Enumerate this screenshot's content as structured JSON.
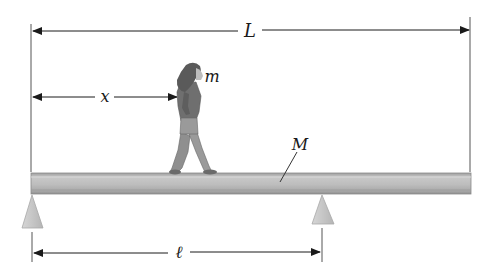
{
  "diagram": {
    "labels": {
      "total_length": "L",
      "person_position": "x",
      "person_mass": "m",
      "beam_mass": "M",
      "support_distance": "ℓ"
    },
    "colors": {
      "beam_fill": "#b9b9b9",
      "beam_edge": "#8a8a8a",
      "support_fill": "#c4c4c4",
      "line": "#1a1a1a",
      "guide_line": "#555555",
      "person_clothes": "#8e8e8e",
      "person_dark": "#5a5a5a"
    }
  }
}
